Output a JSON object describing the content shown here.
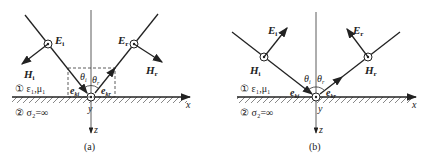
{
  "panels": [
    {
      "caption": "(a)",
      "incident": {
        "E_label": "E",
        "E_sub": "i",
        "H_label": "H",
        "H_sub": "i",
        "k_label": "e",
        "k_sub": "ki",
        "theta": "θ",
        "theta_sub": "i"
      },
      "reflected": {
        "E_label": "E",
        "E_sub": "r",
        "H_label": "H",
        "H_sub": "r",
        "k_label": "e",
        "k_sub": "kr",
        "theta": "θ",
        "theta_sub": "r"
      },
      "field_out_of_page": "E",
      "medium1": "① ε₁,μ₁",
      "medium2": "② σ₂=∞",
      "axes": {
        "x": "x",
        "y": "y",
        "z": "z"
      }
    },
    {
      "caption": "(b)",
      "incident": {
        "E_label": "E",
        "E_sub": "i",
        "H_label": "H",
        "H_sub": "i",
        "k_label": "e",
        "k_sub": "ki",
        "theta": "θ",
        "theta_sub": "i"
      },
      "reflected": {
        "E_label": "E",
        "E_sub": "r",
        "H_label": "H",
        "H_sub": "r",
        "k_label": "e",
        "k_sub": "kr",
        "theta": "θ",
        "theta_sub": "r"
      },
      "field_out_of_page": "H",
      "medium1": "① ε₁,μ₁",
      "medium2": "② σ₂=∞",
      "axes": {
        "x": "x",
        "y": "y",
        "z": "z"
      }
    }
  ]
}
